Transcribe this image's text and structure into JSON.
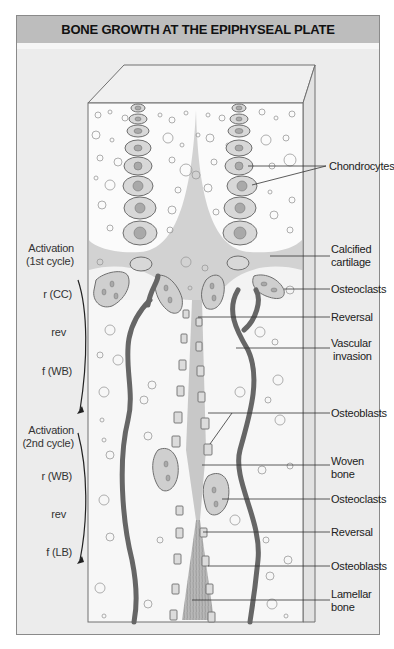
{
  "title": "BONE GROWTH AT THE EPIPHYSEAL PLATE",
  "left_annotations": {
    "cycle1": {
      "activation": "Activation",
      "activation_sub": "(1st cycle)",
      "resorption": "r (CC)",
      "reversal": "rev",
      "formation": "f (WB)"
    },
    "cycle2": {
      "activation": "Activation",
      "activation_sub": "(2nd cycle)",
      "resorption": "r (WB)",
      "reversal": "rev",
      "formation": "f (LB)"
    }
  },
  "right_labels": [
    {
      "line1": "Chondrocytes",
      "line2": ""
    },
    {
      "line1": "Calcified",
      "line2": "cartilage"
    },
    {
      "line1": "Osteoclasts",
      "line2": ""
    },
    {
      "line1": "Reversal",
      "line2": ""
    },
    {
      "line1": "Vascular",
      "line2": "invasion"
    },
    {
      "line1": "Osteoblasts",
      "line2": ""
    },
    {
      "line1": "Woven",
      "line2": "bone"
    },
    {
      "line1": "Osteoclasts",
      "line2": ""
    },
    {
      "line1": "Reversal",
      "line2": ""
    },
    {
      "line1": "Osteoblasts",
      "line2": ""
    },
    {
      "line1": "Lamellar",
      "line2": "bone"
    }
  ],
  "colors": {
    "title_bar": "#bdbdbd",
    "frame_bg": "#ececec",
    "cartilage_light": "#fbfbfb",
    "calcified": "#cfcfcf",
    "vessel": "#6a6a6a",
    "cell_fill": "#d6d6d6"
  }
}
